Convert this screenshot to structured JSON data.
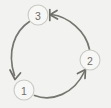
{
  "diagram": {
    "type": "cycle",
    "title": "",
    "background_color": "#f2f2f0",
    "arc_color": "#76766f",
    "node_fill_color": "#f7f7f5",
    "node_stroke_color": "#c9c9c6",
    "label_color": "#6e6e6b",
    "nodes": [
      {
        "id": "node-1",
        "label": "1",
        "cx": 24,
        "cy": 90,
        "r": 10
      },
      {
        "id": "node-2",
        "label": "2",
        "cx": 90,
        "cy": 60,
        "r": 10
      },
      {
        "id": "node-3",
        "label": "3",
        "cx": 38,
        "cy": 15,
        "r": 10
      }
    ],
    "edges": [
      {
        "id": "edge-1-to-2",
        "from": "1",
        "to": "2",
        "direction": "clockwise-bottom"
      },
      {
        "id": "edge-2-to-3",
        "from": "2",
        "to": "3",
        "direction": "clockwise-right"
      },
      {
        "id": "edge-3-to-1",
        "from": "3",
        "to": "1",
        "direction": "clockwise-left"
      }
    ]
  }
}
